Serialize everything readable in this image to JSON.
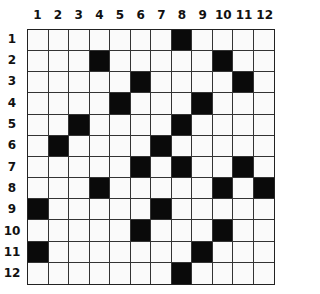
{
  "puzzle": {
    "rows": 12,
    "cols": 12,
    "column_labels": [
      "1",
      "2",
      "3",
      "4",
      "5",
      "6",
      "7",
      "8",
      "9",
      "10",
      "11",
      "12"
    ],
    "row_labels": [
      "1",
      "2",
      "3",
      "4",
      "5",
      "6",
      "7",
      "8",
      "9",
      "10",
      "11",
      "12"
    ],
    "black_cells": [
      [
        1,
        8
      ],
      [
        2,
        4
      ],
      [
        2,
        10
      ],
      [
        3,
        6
      ],
      [
        3,
        11
      ],
      [
        4,
        5
      ],
      [
        4,
        9
      ],
      [
        5,
        3
      ],
      [
        5,
        8
      ],
      [
        6,
        2
      ],
      [
        6,
        7
      ],
      [
        7,
        6
      ],
      [
        7,
        8
      ],
      [
        7,
        11
      ],
      [
        8,
        4
      ],
      [
        8,
        10
      ],
      [
        8,
        12
      ],
      [
        9,
        1
      ],
      [
        9,
        7
      ],
      [
        10,
        6
      ],
      [
        10,
        10
      ],
      [
        11,
        1
      ],
      [
        11,
        9
      ],
      [
        12,
        8
      ]
    ],
    "colors": {
      "black": "#0a0a0a",
      "white": "#fafafa",
      "line": "#333333"
    }
  }
}
